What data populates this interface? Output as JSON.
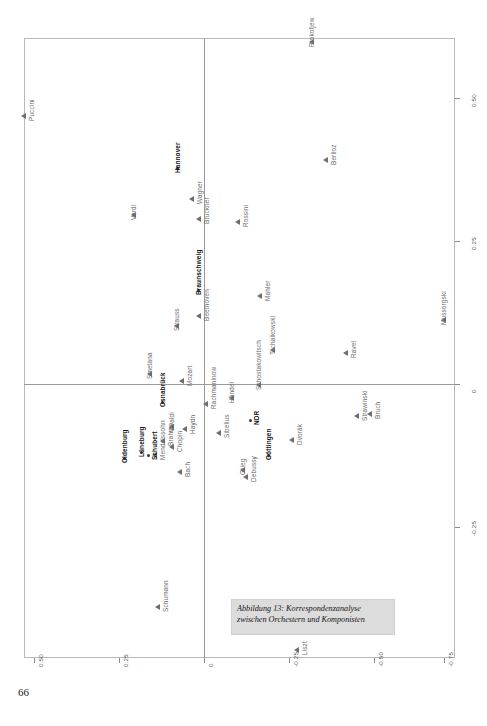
{
  "page": {
    "number": "66"
  },
  "caption": {
    "line1": "Abbildung 13: Korrespondenzanalyse",
    "line2": "zwischen Orchestern und Komponisten"
  },
  "chart_data": {
    "type": "scatter",
    "title": "Abbildung 13: Korrespondenzanalyse zwischen Orchestern und Komponisten",
    "xlabel": "",
    "ylabel": "",
    "grid": false,
    "legend": "none",
    "note": "Correspondence-analysis biplot. The scanned page is rotated 90 degrees, so printed axis numbers read sideways. Horizontal printed axis (bottom of image) ticks: 0.50, 0.25, 0, -0.25, -0.50, -0.75. Vertical printed axis (right of image) ticks: 0.50, 0.25, 0, -0.25.",
    "axis_bottom": {
      "ticks": [
        "0.50",
        "0.25",
        "0",
        "-0.25",
        "-0.50",
        "-0.75"
      ],
      "positions_px": [
        34,
        119,
        204,
        289,
        374,
        444
      ]
    },
    "axis_right": {
      "ticks": [
        "0.50",
        "0.25",
        "0",
        "-0.25"
      ],
      "positions_px": [
        98,
        241,
        384,
        527
      ]
    },
    "series": [
      {
        "name": "Komponisten",
        "marker": "triangle",
        "points": [
          {
            "label": "Puccini",
            "px": 24,
            "py": 116,
            "lx": 4,
            "ly": 5
          },
          {
            "label": "Prokofjew",
            "px": 312,
            "py": 42,
            "lx": -4,
            "ly": 5
          },
          {
            "label": "Berlioz",
            "px": 326,
            "py": 160,
            "lx": 4,
            "ly": 5
          },
          {
            "label": "Verdi",
            "px": 134,
            "py": 215,
            "lx": -4,
            "ly": 5
          },
          {
            "label": "Wagner",
            "px": 192,
            "py": 199,
            "lx": 4,
            "ly": 5
          },
          {
            "label": "Bruckner",
            "px": 199,
            "py": 219,
            "lx": 4,
            "ly": 5
          },
          {
            "label": "Rossini",
            "px": 238,
            "py": 222,
            "lx": 4,
            "ly": 5
          },
          {
            "label": "Mahler",
            "px": 260,
            "py": 296,
            "lx": 4,
            "ly": 5
          },
          {
            "label": "Beethoven",
            "px": 199,
            "py": 316,
            "lx": 4,
            "ly": 5
          },
          {
            "label": "Strauss",
            "px": 177,
            "py": 326,
            "lx": -4,
            "ly": 5
          },
          {
            "label": "Mussorgski",
            "px": 444,
            "py": 320,
            "lx": -4,
            "ly": 5
          },
          {
            "label": "Tschaikowski",
            "px": 273,
            "py": 350,
            "lx": -4,
            "ly": 5
          },
          {
            "label": "Ravel",
            "px": 346,
            "py": 353,
            "lx": 4,
            "ly": 5
          },
          {
            "label": "Smetana",
            "px": 150,
            "py": 374,
            "lx": -4,
            "ly": 5
          },
          {
            "label": "Mozart",
            "px": 182,
            "py": 381,
            "lx": 4,
            "ly": 5
          },
          {
            "label": "Schostakowitsch",
            "px": 259,
            "py": 385,
            "lx": -4,
            "ly": 5
          },
          {
            "label": "Händel",
            "px": 232,
            "py": 398,
            "lx": -4,
            "ly": 5
          },
          {
            "label": "Rachmaninow",
            "px": 206,
            "py": 404,
            "lx": 4,
            "ly": 5
          },
          {
            "label": "Strawinski",
            "px": 357,
            "py": 416,
            "lx": 4,
            "ly": 5
          },
          {
            "label": "Bruch",
            "px": 370,
            "py": 414,
            "lx": 4,
            "ly": 5
          },
          {
            "label": "Vivaldi",
            "px": 172,
            "py": 427,
            "lx": -4,
            "ly": 5
          },
          {
            "label": "Haydn",
            "px": 185,
            "py": 429,
            "lx": 4,
            "ly": 5
          },
          {
            "label": "Sibelius",
            "px": 219,
            "py": 433,
            "lx": 4,
            "ly": 5
          },
          {
            "label": "Dvorák",
            "px": 292,
            "py": 440,
            "lx": 4,
            "ly": 5
          },
          {
            "label": "Brahms",
            "px": 163,
            "py": 441,
            "lx": 4,
            "ly": 5
          },
          {
            "label": "Chopin",
            "px": 172,
            "py": 447,
            "lx": 4,
            "ly": 5
          },
          {
            "label": "Mendelssohn",
            "px": 155,
            "py": 455,
            "lx": 4,
            "ly": 5
          },
          {
            "label": "Bach",
            "px": 180,
            "py": 472,
            "lx": 4,
            "ly": 5
          },
          {
            "label": "Grieg",
            "px": 243,
            "py": 470,
            "lx": -4,
            "ly": 5
          },
          {
            "label": "Debussy",
            "px": 246,
            "py": 477,
            "lx": 4,
            "ly": 5
          },
          {
            "label": "Schumann",
            "px": 158,
            "py": 607,
            "lx": 4,
            "ly": 5
          },
          {
            "label": "Liszt",
            "px": 297,
            "py": 650,
            "lx": 4,
            "ly": 5
          }
        ]
      },
      {
        "name": "Orchester",
        "marker": "dot",
        "points": [
          {
            "label": "Hannover",
            "px": 177,
            "py": 168,
            "lx": -3,
            "ly": 5
          },
          {
            "label": "Braunschweig",
            "px": 198,
            "py": 290,
            "lx": -3,
            "ly": 5
          },
          {
            "label": "Osnabrück",
            "px": 162,
            "py": 402,
            "lx": -3,
            "ly": 5
          },
          {
            "label": "NDR",
            "px": 250,
            "py": 420,
            "lx": 3,
            "ly": 5
          },
          {
            "label": "Lüneburg",
            "px": 141,
            "py": 452,
            "lx": -3,
            "ly": 5
          },
          {
            "label": "Oldenburg",
            "px": 124,
            "py": 458,
            "lx": -3,
            "ly": 5
          },
          {
            "label": "Schubert",
            "px": 148,
            "py": 455,
            "lx": 3,
            "ly": 5
          },
          {
            "label": "Göttingen",
            "px": 268,
            "py": 455,
            "lx": -3,
            "ly": 5
          }
        ]
      }
    ]
  }
}
